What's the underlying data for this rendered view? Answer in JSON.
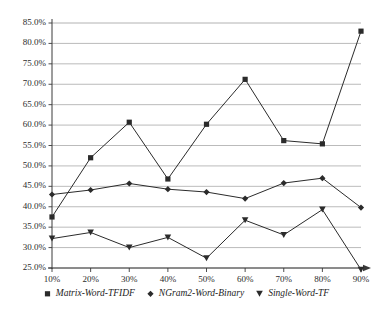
{
  "chart_data": {
    "type": "line",
    "title": "",
    "xlabel": "",
    "ylabel": "",
    "x": [
      "10%",
      "20%",
      "30%",
      "40%",
      "50%",
      "60%",
      "70%",
      "80%",
      "90%"
    ],
    "categories": [
      "10%",
      "20%",
      "30%",
      "40%",
      "50%",
      "60%",
      "70%",
      "80%",
      "90%"
    ],
    "ylim": [
      25.0,
      85.0
    ],
    "ytick_labels": [
      "85.0%",
      "80.0%",
      "75.0%",
      "70.0%",
      "65.0%",
      "60.0%",
      "55.0%",
      "50.0%",
      "45.0%",
      "40.0%",
      "35.0%",
      "30.0%",
      "25.0%"
    ],
    "ytick_values": [
      85.0,
      80.0,
      75.0,
      70.0,
      65.0,
      60.0,
      55.0,
      50.0,
      45.0,
      40.0,
      35.0,
      30.0,
      25.0
    ],
    "grid": true,
    "legend_position": "bottom",
    "series": [
      {
        "name": "Matrix-Word-TFIDF",
        "marker": "square",
        "color": "#2b2b2b",
        "values": [
          37.5,
          52.0,
          60.7,
          46.8,
          60.2,
          71.2,
          56.2,
          55.4,
          83.0
        ]
      },
      {
        "name": "NGram2-Word-Binary",
        "marker": "diamond",
        "color": "#2b2b2b",
        "values": [
          43.0,
          44.1,
          45.7,
          44.3,
          43.6,
          42.0,
          45.8,
          47.0,
          39.8
        ]
      },
      {
        "name": "Single-Word-TF",
        "marker": "triangle",
        "color": "#2b2b2b",
        "values": [
          32.2,
          33.7,
          30.0,
          32.5,
          27.4,
          36.7,
          33.1,
          39.3,
          24.6
        ]
      }
    ]
  },
  "axes": {
    "grid_color": "#a9a9a9",
    "axis_color": "#3a3a3a",
    "line_color": "#3f3f3f"
  },
  "legend": {
    "items": [
      {
        "label": "Matrix-Word-TFIDF",
        "marker": "square-marker-icon"
      },
      {
        "label": "NGram2-Word-Binary",
        "marker": "diamond-marker-icon"
      },
      {
        "label": "Single-Word-TF",
        "marker": "triangle-marker-icon"
      }
    ]
  }
}
